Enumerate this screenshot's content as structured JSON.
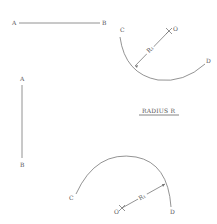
{
  "diagram": {
    "title": "RADIUS R",
    "line_horizontal": {
      "start_label": "A",
      "end_label": "B"
    },
    "line_vertical": {
      "start_label": "A",
      "end_label": "B"
    },
    "arc_top": {
      "start_label": "C",
      "end_label": "D",
      "center_label": "O",
      "radius_label": "R₁"
    },
    "arc_bottom": {
      "start_label": "C",
      "end_label": "D",
      "center_label": "O",
      "radius_label": "R₁"
    }
  },
  "colors": {
    "line": "#777777",
    "text": "#555555",
    "background": "#ffffff"
  }
}
